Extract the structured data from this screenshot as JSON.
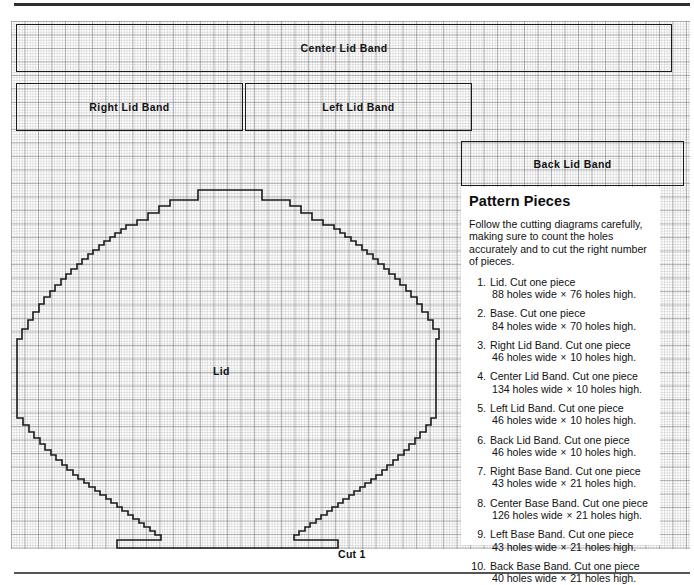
{
  "sheet": {
    "grid_color": "#5a5a5f",
    "outline_color": "#1a1a1a"
  },
  "bands": [
    {
      "id": "center",
      "label": "Center Lid Band"
    },
    {
      "id": "right",
      "label": "Right Lid Band"
    },
    {
      "id": "left",
      "label": "Left Lid Band"
    },
    {
      "id": "back",
      "label": "Back Lid Band"
    }
  ],
  "lid": {
    "label": "Lid",
    "cut_label": "Cut 1"
  },
  "panel": {
    "heading": "Pattern Pieces",
    "intro": "Follow the cutting diagrams carefully, making sure to count the holes accurately and to cut the right number of pieces.",
    "items": [
      {
        "num": "1.",
        "name": "Lid. Cut one piece",
        "dims_w": "88 holes wide",
        "dims_h": "76 holes high."
      },
      {
        "num": "2.",
        "name": "Base. Cut one piece",
        "dims_w": "84 holes wide",
        "dims_h": "70 holes high."
      },
      {
        "num": "3.",
        "name": "Right Lid Band. Cut one piece",
        "dims_w": "46 holes wide",
        "dims_h": "10 holes high."
      },
      {
        "num": "4.",
        "name": "Center Lid Band. Cut one piece",
        "dims_w": "134 holes wide",
        "dims_h": "10 holes high."
      },
      {
        "num": "5.",
        "name": "Left Lid Band. Cut one piece",
        "dims_w": "46 holes wide",
        "dims_h": "10 holes high."
      },
      {
        "num": "6.",
        "name": "Back Lid Band. Cut one piece",
        "dims_w": "46 holes wide",
        "dims_h": "10 holes high."
      },
      {
        "num": "7.",
        "name": "Right Base Band. Cut one piece",
        "dims_w": "43 holes wide",
        "dims_h": "21 holes high."
      },
      {
        "num": "8.",
        "name": "Center Base Band. Cut one piece",
        "dims_w": "126 holes wide",
        "dims_h": "21 holes high."
      },
      {
        "num": "9.",
        "name": "Left Base Band. Cut one piece",
        "dims_w": "43 holes wide",
        "dims_h": "21 holes high."
      },
      {
        "num": "10.",
        "name": "Back Base Band. Cut one piece",
        "dims_w": "40 holes wide",
        "dims_h": "21 holes high."
      }
    ]
  }
}
